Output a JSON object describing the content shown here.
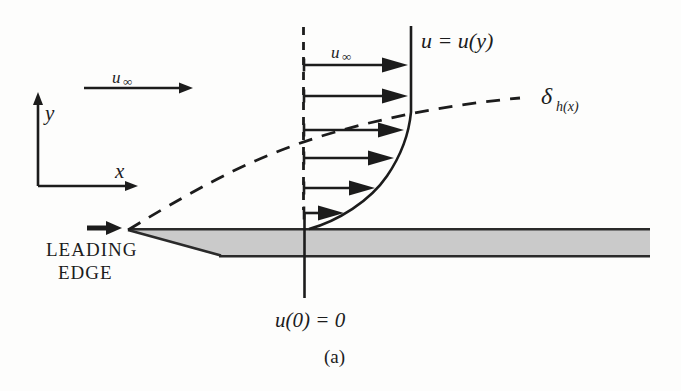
{
  "figure": {
    "caption": "(a)",
    "colors": {
      "ink": "#1c1c1c",
      "plate_fill": "#cacaca",
      "background": "#fdfdfc"
    }
  },
  "axes": {
    "y_label": "y",
    "x_label": "x"
  },
  "free_stream": {
    "label_base": "u",
    "label_sub": "∞"
  },
  "profile": {
    "title": "u = u(y)",
    "free_stream_label_base": "u",
    "free_stream_label_sub": "∞",
    "no_slip_label": "u(0) = 0",
    "arrows": [
      {
        "y": 65,
        "tip": 408
      },
      {
        "y": 96,
        "tip": 408
      },
      {
        "y": 130,
        "tip": 404
      },
      {
        "y": 158,
        "tip": 394
      },
      {
        "y": 188,
        "tip": 375
      },
      {
        "y": 213,
        "tip": 344
      }
    ],
    "base_x": 304
  },
  "boundary_layer": {
    "label_base": "δ",
    "label_sub": "h(x)"
  },
  "leading_edge": {
    "line1": "LEADING",
    "line2": "EDGE"
  }
}
